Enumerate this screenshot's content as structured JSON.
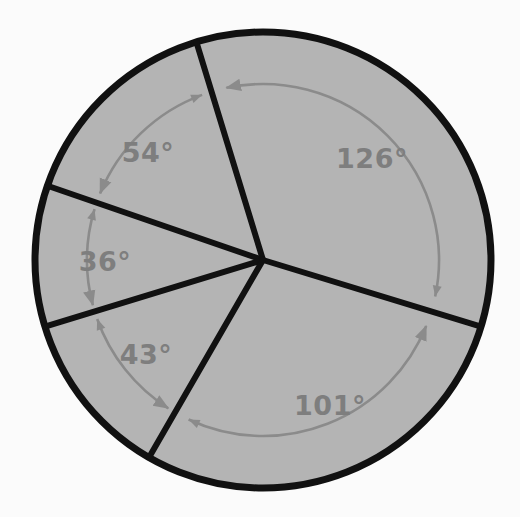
{
  "figure": {
    "canvas": {
      "width": 520,
      "height": 517
    },
    "background_color": "#fbfbfb",
    "circle": {
      "center_x": 263,
      "center_y": 260,
      "radius": 228,
      "fill_color": "#b4b4b4",
      "stroke_color": "#111111",
      "stroke_width": 7
    },
    "radius_lines": {
      "stroke_color": "#111111",
      "stroke_width": 6
    },
    "arcs": {
      "stroke_color": "#8b8b8b",
      "stroke_width": 2.6,
      "radius": 176
    },
    "label_color": "#7e7e7e",
    "label_font_size": 27
  },
  "chart_data": {
    "type": "pie",
    "categories": [
      "126° sector",
      "54° sector",
      "36° sector",
      "43° sector",
      "101° sector"
    ],
    "values": [
      126,
      54,
      36,
      43,
      101
    ],
    "unit": "degrees",
    "total": 360,
    "legend": "none",
    "grid": false,
    "sectors": [
      {
        "label": "126°",
        "value": 126,
        "start_angle_deg": 343,
        "end_angle_deg": 107,
        "label_x": 372,
        "label_y": 168
      },
      {
        "label": "54°",
        "value": 54,
        "start_angle_deg": 107,
        "end_angle_deg": 161,
        "label_x": 148,
        "label_y": 162
      },
      {
        "label": "36°",
        "value": 36,
        "start_angle_deg": 161,
        "end_angle_deg": 197,
        "label_x": 105,
        "label_y": 271
      },
      {
        "label": "43°",
        "value": 43,
        "start_angle_deg": 197,
        "end_angle_deg": 240,
        "label_x": 146,
        "label_y": 364
      },
      {
        "label": "101°",
        "value": 101,
        "start_angle_deg": 240,
        "end_angle_deg": 343,
        "label_x": 330,
        "label_y": 415
      }
    ]
  }
}
